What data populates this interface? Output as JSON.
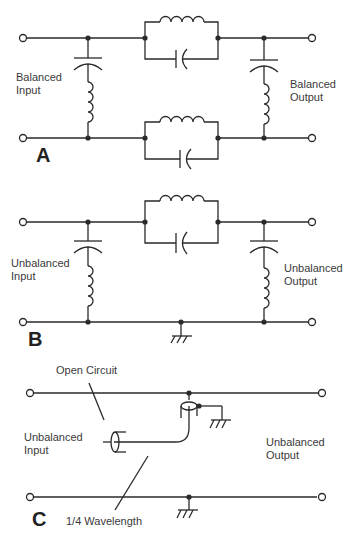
{
  "diagram": {
    "type": "circuit-schematic",
    "panels": [
      {
        "id": "A",
        "label": "A",
        "input_label": [
          "Balanced",
          "Input"
        ],
        "output_label": [
          "Balanced",
          "Output"
        ],
        "description": "Balanced filter: series parallel LC tanks in both lines, series LC shunt arms across lines at input and output"
      },
      {
        "id": "B",
        "label": "B",
        "input_label": [
          "Unbalanced",
          "Input"
        ],
        "output_label": [
          "Unbalanced",
          "Output"
        ],
        "description": "Unbalanced filter: series parallel LC tank in top line, series LC shunts to grounded bottom line"
      },
      {
        "id": "C",
        "label": "C",
        "input_label": [
          "Unbalanced",
          "Input"
        ],
        "output_label": [
          "Unbalanced",
          "Output"
        ],
        "annotations": [
          "Open Circuit",
          "1/4 Wavelength"
        ],
        "description": "Quarter-wave open-circuit coaxial stub attached to line, shield grounded"
      }
    ],
    "colors": {
      "line": "#2a2a2a",
      "background": "#ffffff"
    }
  }
}
